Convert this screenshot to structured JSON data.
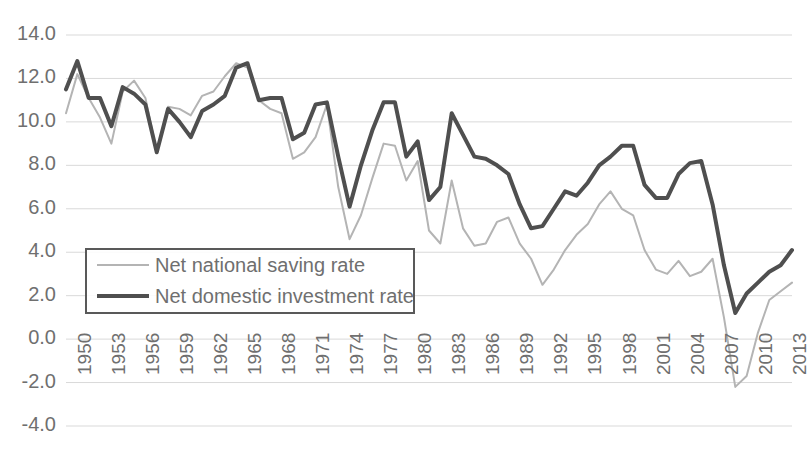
{
  "chart_data": {
    "type": "line",
    "title": "",
    "subtitle": "",
    "xlabel": "",
    "ylabel": "",
    "xlim": [
      1950,
      2014
    ],
    "ylim": [
      -4.0,
      14.0
    ],
    "grid": true,
    "legend_position": "center-left inside plot",
    "y_ticks": [
      "14.0",
      "12.0",
      "10.0",
      "8.0",
      "6.0",
      "4.0",
      "2.0",
      "0.0",
      "-2.0",
      "-4.0"
    ],
    "y_tick_values": [
      14,
      12,
      10,
      8,
      6,
      4,
      2,
      0,
      -2,
      -4
    ],
    "x_ticks": [
      "1950",
      "1953",
      "1956",
      "1959",
      "1962",
      "1965",
      "1968",
      "1971",
      "1974",
      "1977",
      "1980",
      "1983",
      "1986",
      "1989",
      "1992",
      "1995",
      "1998",
      "2001",
      "2004",
      "2007",
      "2010",
      "2013"
    ],
    "x_tick_values": [
      1950,
      1953,
      1956,
      1959,
      1962,
      1965,
      1968,
      1971,
      1974,
      1977,
      1980,
      1983,
      1986,
      1989,
      1992,
      1995,
      1998,
      2001,
      2004,
      2007,
      2010,
      2013
    ],
    "x": [
      1950,
      1951,
      1952,
      1953,
      1954,
      1955,
      1956,
      1957,
      1958,
      1959,
      1960,
      1961,
      1962,
      1963,
      1964,
      1965,
      1966,
      1967,
      1968,
      1969,
      1970,
      1971,
      1972,
      1973,
      1974,
      1975,
      1976,
      1977,
      1978,
      1979,
      1980,
      1981,
      1982,
      1983,
      1984,
      1985,
      1986,
      1987,
      1988,
      1989,
      1990,
      1991,
      1992,
      1993,
      1994,
      1995,
      1996,
      1997,
      1998,
      1999,
      2000,
      2001,
      2002,
      2003,
      2004,
      2005,
      2006,
      2007,
      2008,
      2009,
      2010,
      2011,
      2012,
      2013,
      2014
    ],
    "series": [
      {
        "name": "Net national saving rate",
        "color": "#b4b4b4",
        "width": 2,
        "values": [
          10.4,
          12.2,
          11.1,
          10.2,
          9.0,
          11.4,
          11.9,
          11.1,
          8.6,
          10.7,
          10.6,
          10.3,
          11.2,
          11.4,
          12.1,
          12.7,
          12.5,
          11.0,
          10.6,
          10.4,
          8.3,
          8.6,
          9.3,
          10.8,
          7.0,
          4.6,
          5.7,
          7.4,
          9.0,
          8.9,
          7.3,
          8.2,
          5.0,
          4.4,
          7.3,
          5.1,
          4.3,
          4.4,
          5.4,
          5.6,
          4.4,
          3.7,
          2.5,
          3.2,
          4.1,
          4.8,
          5.3,
          6.2,
          6.8,
          6.0,
          5.7,
          4.1,
          3.2,
          3.0,
          3.6,
          2.9,
          3.1,
          3.7,
          1.0,
          -2.2,
          -1.7,
          0.3,
          1.8,
          2.2,
          2.6
        ]
      },
      {
        "name": "Net domestic investment rate",
        "color": "#4f4f4f",
        "width": 4,
        "values": [
          11.5,
          12.8,
          11.1,
          11.1,
          9.8,
          11.6,
          11.3,
          10.8,
          8.6,
          10.6,
          10.0,
          9.3,
          10.5,
          10.8,
          11.2,
          12.5,
          12.7,
          11.0,
          11.1,
          11.1,
          9.2,
          9.5,
          10.8,
          10.9,
          8.4,
          6.1,
          8.0,
          9.6,
          10.9,
          10.9,
          8.4,
          9.1,
          6.4,
          7.0,
          10.4,
          9.4,
          8.4,
          8.3,
          8.0,
          7.6,
          6.2,
          5.1,
          5.2,
          6.0,
          6.8,
          6.6,
          7.2,
          8.0,
          8.4,
          8.9,
          8.9,
          7.1,
          6.5,
          6.5,
          7.6,
          8.1,
          8.2,
          6.2,
          3.4,
          1.2,
          2.1,
          2.6,
          3.1,
          3.4,
          4.1
        ]
      }
    ]
  },
  "legend": {
    "items": [
      {
        "label": "Net national saving rate",
        "style": "light"
      },
      {
        "label": "Net domestic investment rate",
        "style": "dark"
      }
    ]
  },
  "colors": {
    "saving_line": "#b4b4b4",
    "investment_line": "#4f4f4f",
    "grid": "#d9d9d9",
    "tick_text": "#6f6f6f",
    "legend_border": "#595959",
    "background": "#ffffff"
  }
}
